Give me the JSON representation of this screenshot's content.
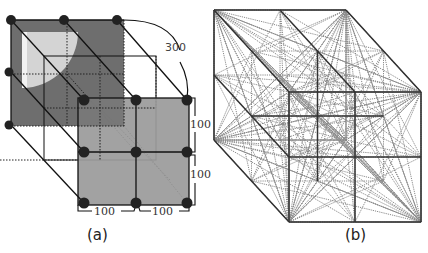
{
  "figure": {
    "panel_a": {
      "caption": "(a)",
      "dimension_labels": {
        "diagonal": "300",
        "vertical_top": "100",
        "vertical_bottom": "100",
        "horizontal_left": "100",
        "horizontal_right": "100"
      },
      "grid": "3x3x3 cube of nodes",
      "colors": {
        "back_face": "#6e6e6e",
        "front_face": "#9a9a9a",
        "quadrant": "#d4d4d4",
        "node": "#222222",
        "edge": "#111111"
      }
    },
    "panel_b": {
      "caption": "(b)",
      "description": "2x2x2 cube lattice with dotted connecting lines between all lattice vertices",
      "colors": {
        "edge": "#333333",
        "connection": "#8a8a8a"
      }
    }
  }
}
